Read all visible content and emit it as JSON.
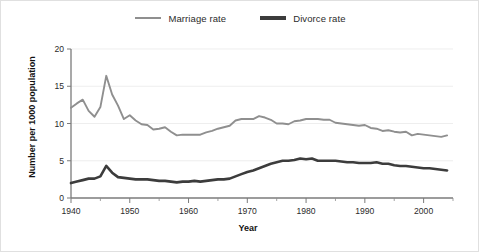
{
  "legend": {
    "position": "top-center",
    "entries": [
      {
        "label": "Marriage rate",
        "color": "#8f8f8f",
        "width": 2.4,
        "icon": "line-swatch-icon"
      },
      {
        "label": "Divorce rate",
        "color": "#3c3c3c",
        "width": 3.4,
        "icon": "line-swatch-icon"
      }
    ]
  },
  "axes": {
    "x_title": "Year",
    "y_title": "Number per 1000 population",
    "x_ticks": [
      "1940",
      "1950",
      "1960",
      "1970",
      "1980",
      "1990",
      "2000"
    ],
    "y_ticks": [
      "0",
      "5",
      "10",
      "15",
      "20"
    ]
  },
  "chart_data": {
    "type": "line",
    "title": "",
    "xlabel": "Year",
    "ylabel": "Number per 1000 population",
    "xlim": [
      1940,
      2005
    ],
    "ylim": [
      0,
      20
    ],
    "grid": true,
    "x_major_step": 10,
    "x_minor_step": 5,
    "y_major_step": 5,
    "legend_position": "top-center",
    "x": [
      1940,
      1941,
      1942,
      1943,
      1944,
      1945,
      1946,
      1947,
      1948,
      1949,
      1950,
      1951,
      1952,
      1953,
      1954,
      1955,
      1956,
      1957,
      1958,
      1959,
      1960,
      1961,
      1962,
      1963,
      1964,
      1965,
      1966,
      1967,
      1968,
      1969,
      1970,
      1971,
      1972,
      1973,
      1974,
      1975,
      1976,
      1977,
      1978,
      1979,
      1980,
      1981,
      1982,
      1983,
      1984,
      1985,
      1986,
      1987,
      1988,
      1989,
      1990,
      1991,
      1992,
      1993,
      1994,
      1995,
      1996,
      1997,
      1998,
      1999,
      2000,
      2001,
      2002,
      2003,
      2004
    ],
    "series": [
      {
        "name": "Marriage rate",
        "color": "#8f8f8f",
        "values": [
          12.1,
          12.7,
          13.2,
          11.7,
          10.9,
          12.2,
          16.4,
          13.9,
          12.4,
          10.6,
          11.1,
          10.4,
          9.9,
          9.8,
          9.2,
          9.3,
          9.5,
          8.9,
          8.4,
          8.5,
          8.5,
          8.5,
          8.5,
          8.8,
          9.0,
          9.3,
          9.5,
          9.7,
          10.4,
          10.6,
          10.6,
          10.6,
          11.0,
          10.8,
          10.5,
          10.0,
          10.0,
          9.9,
          10.3,
          10.4,
          10.6,
          10.6,
          10.6,
          10.5,
          10.5,
          10.1,
          10.0,
          9.9,
          9.8,
          9.7,
          9.8,
          9.4,
          9.3,
          9.0,
          9.1,
          8.9,
          8.8,
          8.9,
          8.4,
          8.6,
          8.5,
          8.4,
          8.3,
          8.2,
          8.4
        ],
        "width": 1.9
      },
      {
        "name": "Divorce rate",
        "color": "#3c3c3c",
        "values": [
          2.0,
          2.2,
          2.4,
          2.6,
          2.6,
          2.9,
          4.3,
          3.4,
          2.8,
          2.7,
          2.6,
          2.5,
          2.5,
          2.5,
          2.4,
          2.3,
          2.3,
          2.2,
          2.1,
          2.2,
          2.2,
          2.3,
          2.2,
          2.3,
          2.4,
          2.5,
          2.5,
          2.6,
          2.9,
          3.2,
          3.5,
          3.7,
          4.0,
          4.3,
          4.6,
          4.8,
          5.0,
          5.0,
          5.1,
          5.3,
          5.2,
          5.3,
          5.0,
          5.0,
          5.0,
          5.0,
          4.9,
          4.8,
          4.8,
          4.7,
          4.7,
          4.7,
          4.8,
          4.6,
          4.6,
          4.4,
          4.3,
          4.3,
          4.2,
          4.1,
          4.0,
          4.0,
          3.9,
          3.8,
          3.7
        ],
        "width": 2.6
      }
    ]
  }
}
